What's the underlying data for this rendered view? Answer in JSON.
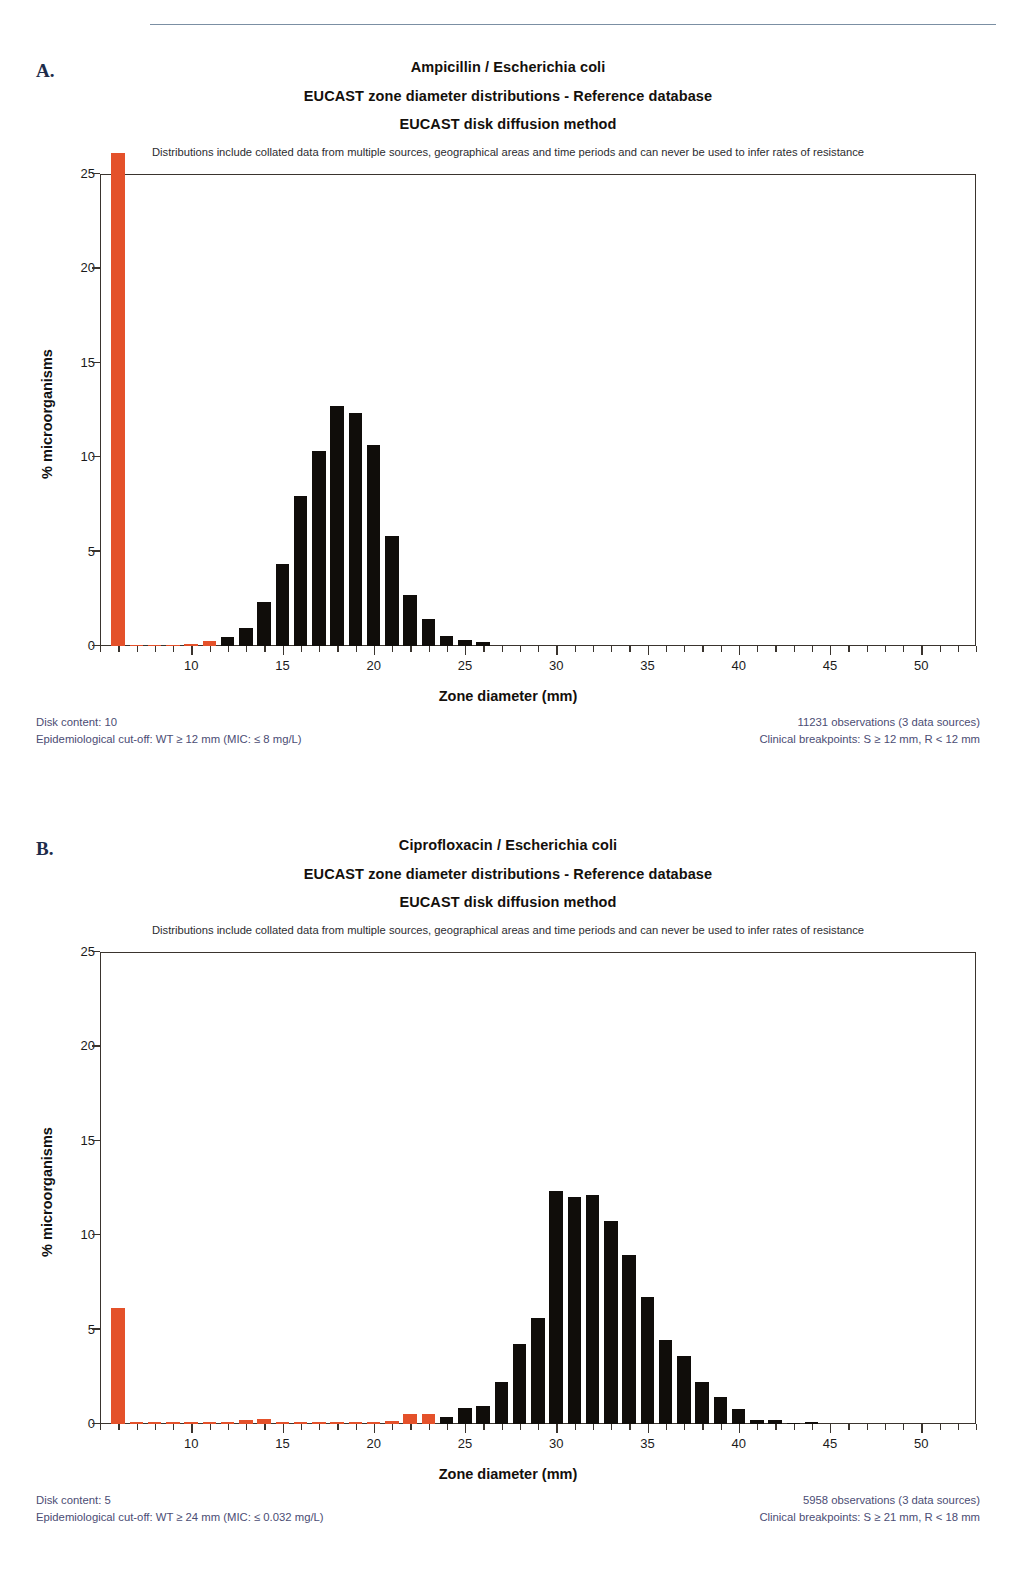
{
  "page": {
    "rule": true
  },
  "panels": [
    {
      "letter": "A.",
      "titles": [
        "Ampicillin / Escherichia coli",
        "EUCAST zone diameter distributions - Reference database",
        "EUCAST disk diffusion method"
      ],
      "subnote": "Distributions include collated data from multiple sources, geographical areas and time periods and can never be used to infer rates of resistance",
      "footer": {
        "disk_content": "Disk content: 10",
        "ecoff": "Epidemiological cut-off: WT ≥ 12 mm (MIC: ≤ 8 mg/L)",
        "observations": "11231 observations (3 data sources)",
        "breakpoints": "Clinical breakpoints: S ≥ 12 mm,  R < 12 mm"
      },
      "chart_data": {
        "type": "bar",
        "title": "Ampicillin / Escherichia coli",
        "xlabel": "Zone diameter (mm)",
        "ylabel": "% microorganisms",
        "xlim": [
          5,
          53
        ],
        "ylim": [
          0,
          25
        ],
        "yticks": [
          0,
          5,
          10,
          15,
          20,
          25
        ],
        "xticks_major": [
          10,
          15,
          20,
          25,
          30,
          35,
          40,
          45,
          50
        ],
        "grid": false,
        "legend": null,
        "bar_colors": {
          "resistant": "#e4512a",
          "susceptible": "#100d0a"
        },
        "note": "bar at 6 mm is off-scale (clipped above axis top)",
        "bars": [
          {
            "x": 6,
            "value": 26.1,
            "color": "resistant"
          },
          {
            "x": 7,
            "value": 0.05,
            "color": "resistant"
          },
          {
            "x": 8,
            "value": 0.05,
            "color": "resistant"
          },
          {
            "x": 9,
            "value": 0.05,
            "color": "resistant"
          },
          {
            "x": 10,
            "value": 0.1,
            "color": "resistant"
          },
          {
            "x": 11,
            "value": 0.25,
            "color": "resistant"
          },
          {
            "x": 12,
            "value": 0.45,
            "color": "susceptible"
          },
          {
            "x": 13,
            "value": 0.95,
            "color": "susceptible"
          },
          {
            "x": 14,
            "value": 2.3,
            "color": "susceptible"
          },
          {
            "x": 15,
            "value": 4.3,
            "color": "susceptible"
          },
          {
            "x": 16,
            "value": 7.9,
            "color": "susceptible"
          },
          {
            "x": 17,
            "value": 10.3,
            "color": "susceptible"
          },
          {
            "x": 18,
            "value": 12.7,
            "color": "susceptible"
          },
          {
            "x": 19,
            "value": 12.3,
            "color": "susceptible"
          },
          {
            "x": 20,
            "value": 10.6,
            "color": "susceptible"
          },
          {
            "x": 21,
            "value": 5.8,
            "color": "susceptible"
          },
          {
            "x": 22,
            "value": 2.7,
            "color": "susceptible"
          },
          {
            "x": 23,
            "value": 1.4,
            "color": "susceptible"
          },
          {
            "x": 24,
            "value": 0.5,
            "color": "susceptible"
          },
          {
            "x": 25,
            "value": 0.3,
            "color": "susceptible"
          },
          {
            "x": 26,
            "value": 0.2,
            "color": "susceptible"
          }
        ]
      }
    },
    {
      "letter": "B.",
      "titles": [
        "Ciprofloxacin / Escherichia coli",
        "EUCAST zone diameter distributions - Reference database",
        "EUCAST disk diffusion method"
      ],
      "subnote": "Distributions include collated data from multiple sources, geographical areas and time periods and can never be used to infer rates of resistance",
      "footer": {
        "disk_content": "Disk content: 5",
        "ecoff": "Epidemiological cut-off: WT ≥ 24 mm (MIC: ≤ 0.032 mg/L)",
        "observations": "5958 observations (3 data sources)",
        "breakpoints": "Clinical breakpoints: S ≥ 21 mm,  R < 18 mm"
      },
      "chart_data": {
        "type": "bar",
        "title": "Ciprofloxacin / Escherichia coli",
        "xlabel": "Zone diameter (mm)",
        "ylabel": "% microorganisms",
        "xlim": [
          5,
          53
        ],
        "ylim": [
          0,
          25
        ],
        "yticks": [
          0,
          5,
          10,
          15,
          20,
          25
        ],
        "xticks_major": [
          10,
          15,
          20,
          25,
          30,
          35,
          40,
          45,
          50
        ],
        "grid": false,
        "legend": null,
        "bar_colors": {
          "resistant": "#e4512a",
          "susceptible": "#100d0a"
        },
        "bars": [
          {
            "x": 6,
            "value": 6.1,
            "color": "resistant"
          },
          {
            "x": 7,
            "value": 0.08,
            "color": "resistant"
          },
          {
            "x": 8,
            "value": 0.08,
            "color": "resistant"
          },
          {
            "x": 9,
            "value": 0.08,
            "color": "resistant"
          },
          {
            "x": 10,
            "value": 0.08,
            "color": "resistant"
          },
          {
            "x": 11,
            "value": 0.08,
            "color": "resistant"
          },
          {
            "x": 12,
            "value": 0.1,
            "color": "resistant"
          },
          {
            "x": 13,
            "value": 0.2,
            "color": "resistant"
          },
          {
            "x": 14,
            "value": 0.25,
            "color": "resistant"
          },
          {
            "x": 15,
            "value": 0.08,
            "color": "resistant"
          },
          {
            "x": 16,
            "value": 0.08,
            "color": "resistant"
          },
          {
            "x": 17,
            "value": 0.08,
            "color": "resistant"
          },
          {
            "x": 18,
            "value": 0.1,
            "color": "resistant"
          },
          {
            "x": 19,
            "value": 0.1,
            "color": "resistant"
          },
          {
            "x": 20,
            "value": 0.1,
            "color": "resistant"
          },
          {
            "x": 21,
            "value": 0.15,
            "color": "resistant"
          },
          {
            "x": 22,
            "value": 0.5,
            "color": "resistant"
          },
          {
            "x": 23,
            "value": 0.5,
            "color": "resistant"
          },
          {
            "x": 24,
            "value": 0.35,
            "color": "susceptible"
          },
          {
            "x": 25,
            "value": 0.8,
            "color": "susceptible"
          },
          {
            "x": 26,
            "value": 0.95,
            "color": "susceptible"
          },
          {
            "x": 27,
            "value": 2.2,
            "color": "susceptible"
          },
          {
            "x": 28,
            "value": 4.2,
            "color": "susceptible"
          },
          {
            "x": 29,
            "value": 5.6,
            "color": "susceptible"
          },
          {
            "x": 30,
            "value": 12.3,
            "color": "susceptible"
          },
          {
            "x": 31,
            "value": 12.0,
            "color": "susceptible"
          },
          {
            "x": 32,
            "value": 12.1,
            "color": "susceptible"
          },
          {
            "x": 33,
            "value": 10.7,
            "color": "susceptible"
          },
          {
            "x": 34,
            "value": 8.9,
            "color": "susceptible"
          },
          {
            "x": 35,
            "value": 6.7,
            "color": "susceptible"
          },
          {
            "x": 36,
            "value": 4.4,
            "color": "susceptible"
          },
          {
            "x": 37,
            "value": 3.6,
            "color": "susceptible"
          },
          {
            "x": 38,
            "value": 2.2,
            "color": "susceptible"
          },
          {
            "x": 39,
            "value": 1.4,
            "color": "susceptible"
          },
          {
            "x": 40,
            "value": 0.75,
            "color": "susceptible"
          },
          {
            "x": 41,
            "value": 0.2,
            "color": "susceptible"
          },
          {
            "x": 42,
            "value": 0.2,
            "color": "susceptible"
          },
          {
            "x": 43,
            "value": 0.05,
            "color": "susceptible"
          },
          {
            "x": 44,
            "value": 0.1,
            "color": "susceptible"
          }
        ]
      }
    }
  ]
}
